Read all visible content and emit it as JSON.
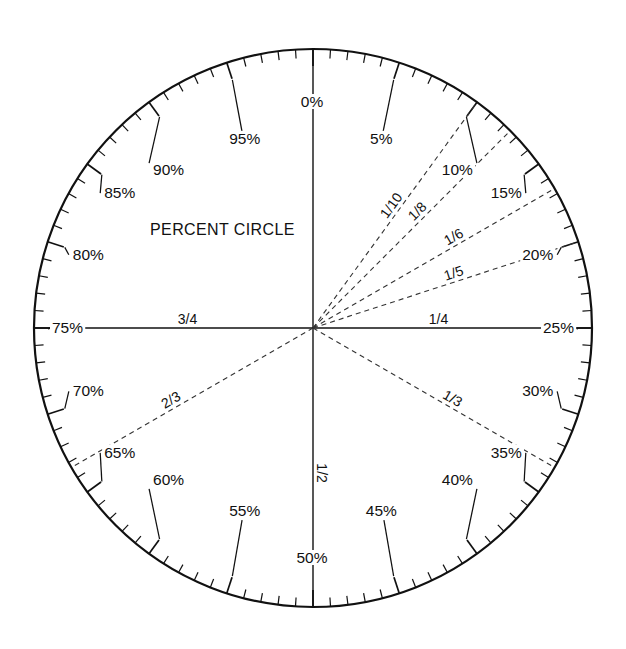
{
  "title": "PERCENT CIRCLE",
  "geometry": {
    "center_x": 313,
    "center_y": 328,
    "radius": 279,
    "width": 626,
    "height": 649
  },
  "style": {
    "stroke": "#111111",
    "dash_stroke": "#333333",
    "background": "#ffffff",
    "rim_width": 2.2,
    "tick_width": 1.3,
    "axis_width": 1.4,
    "dash_pattern": "5,4"
  },
  "chart_data": {
    "type": "pie",
    "title": "PERCENT CIRCLE",
    "scale_min": 0,
    "scale_max": 100,
    "minor_tick_step": 1,
    "major_tick_step": 5,
    "direction": "clockwise",
    "zero_position": "top",
    "percent_labels": [
      {
        "value": 0,
        "text": "0%"
      },
      {
        "value": 5,
        "text": "5%"
      },
      {
        "value": 10,
        "text": "10%"
      },
      {
        "value": 15,
        "text": "15%"
      },
      {
        "value": 20,
        "text": "20%"
      },
      {
        "value": 25,
        "text": "25%"
      },
      {
        "value": 30,
        "text": "30%"
      },
      {
        "value": 35,
        "text": "35%"
      },
      {
        "value": 40,
        "text": "40%"
      },
      {
        "value": 45,
        "text": "45%"
      },
      {
        "value": 50,
        "text": "50%"
      },
      {
        "value": 55,
        "text": "55%"
      },
      {
        "value": 60,
        "text": "60%"
      },
      {
        "value": 65,
        "text": "65%"
      },
      {
        "value": 70,
        "text": "70%"
      },
      {
        "value": 75,
        "text": "75%"
      },
      {
        "value": 80,
        "text": "80%"
      },
      {
        "value": 85,
        "text": "85%"
      },
      {
        "value": 90,
        "text": "90%"
      },
      {
        "value": 95,
        "text": "95%"
      }
    ],
    "fraction_radii": [
      {
        "text": "1/10",
        "percent": 10,
        "style": "dashed",
        "label_frac": 0.52
      },
      {
        "text": "1/8",
        "percent": 12.5,
        "style": "dashed",
        "label_frac": 0.56
      },
      {
        "text": "1/6",
        "percent": 16.667,
        "style": "dashed",
        "label_frac": 0.6
      },
      {
        "text": "1/5",
        "percent": 20,
        "style": "dashed",
        "label_frac": 0.54
      },
      {
        "text": "1/4",
        "percent": 25,
        "style": "solid",
        "label_frac": 0.45
      },
      {
        "text": "1/3",
        "percent": 33.333,
        "style": "dashed",
        "label_frac": 0.56
      },
      {
        "text": "1/2",
        "percent": 50,
        "style": "solid",
        "label_frac": 0.52
      },
      {
        "text": "2/3",
        "percent": 66.667,
        "style": "dashed",
        "label_frac": 0.57
      },
      {
        "text": "3/4",
        "percent": 75,
        "style": "solid",
        "label_frac": 0.45
      },
      {
        "text": "0",
        "percent": 0,
        "style": "solid",
        "label_frac": 0
      }
    ]
  }
}
